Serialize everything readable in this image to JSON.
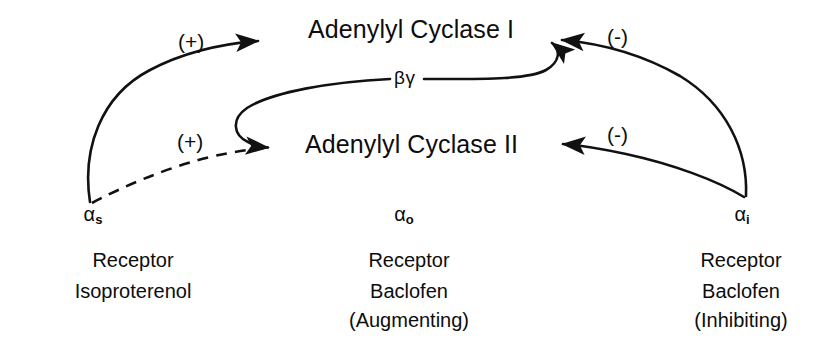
{
  "diagram": {
    "title_unrendered": "",
    "background_color": "#ffffff",
    "stroke_color": "#111111",
    "nodes": {
      "cyclase_1": "Adenylyl Cyclase I",
      "cyclase_2": "Adenylyl Cyclase II",
      "beta_gamma": "βγ"
    },
    "signs": {
      "plus_to_cyclase_1": "(+)",
      "plus_to_cyclase_2": "(+)",
      "minus_to_cyclase_1": "(-)",
      "minus_to_cyclase_2": "(-)"
    },
    "columns": [
      {
        "id": "alpha-s",
        "subunit_symbol": "α",
        "subunit_subscript": "s",
        "lines": [
          "Receptor",
          "Isoproterenol"
        ]
      },
      {
        "id": "alpha-o",
        "subunit_symbol": "α",
        "subunit_subscript": "o",
        "lines": [
          "Receptor",
          "Baclofen",
          "(Augmenting)"
        ]
      },
      {
        "id": "alpha-i",
        "subunit_symbol": "α",
        "subunit_subscript": "i",
        "lines": [
          "Receptor",
          "Baclofen",
          "(Inhibiting)"
        ]
      }
    ],
    "edges": [
      {
        "from": "alpha-s",
        "to": "cyclase_1",
        "style": "solid",
        "sign": "(+)"
      },
      {
        "from": "alpha-s",
        "to": "cyclase_2",
        "style": "dashed",
        "sign": "(+)"
      },
      {
        "from": "beta_gamma",
        "to": "cyclase_2",
        "style": "solid",
        "sign": ""
      },
      {
        "from": "beta_gamma",
        "to": "cyclase_1",
        "style": "solid",
        "sign": ""
      },
      {
        "from": "alpha-i",
        "to": "cyclase_1",
        "style": "solid",
        "sign": "(-)"
      },
      {
        "from": "alpha-i",
        "to": "cyclase_2",
        "style": "solid",
        "sign": "(-)"
      }
    ]
  }
}
